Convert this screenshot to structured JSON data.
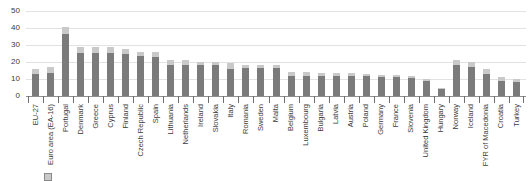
{
  "chart_data": {
    "type": "bar",
    "title": "",
    "subtitle": "",
    "xlabel": "",
    "ylabel": "",
    "ylim": [
      0,
      50
    ],
    "yticks": [
      0,
      10,
      20,
      30,
      40,
      50
    ],
    "grid": true,
    "legend_position": "bottom",
    "orientation": "vertical",
    "xtick_rotation": -90,
    "categories": [
      "EU-27",
      "Euro area (EA-16)",
      "Portugal",
      "Denmark",
      "Greece",
      "Cyprus",
      "Finland",
      "Czech Republic",
      "Spain",
      "Lithuania",
      "Netherlands",
      "Ireland",
      "Slovakia",
      "Italy",
      "Romania",
      "Sweden",
      "Malta",
      "Belgium",
      "Luxembourg",
      "Bulgaria",
      "Latvia",
      "Austria",
      "Poland",
      "Germany",
      "France",
      "Slovenia",
      "United Kingdom",
      "Hungary",
      "Norway",
      "Iceland",
      "FYR of Macedonia",
      "Croatia",
      "Turkey"
    ],
    "series": [
      {
        "name": "lower-segment",
        "color": "#7b7b7b",
        "values": [
          13.0,
          13.5,
          36.5,
          25.5,
          25.5,
          25.5,
          25.0,
          23.5,
          23.0,
          18.5,
          18.5,
          18.0,
          18.0,
          16.0,
          16.5,
          16.5,
          16.5,
          12.0,
          12.0,
          12.0,
          12.0,
          12.0,
          11.5,
          11.0,
          11.0,
          10.5,
          9.0,
          4.0,
          18.0,
          17.0,
          13.0,
          9.0,
          8.0
        ]
      },
      {
        "name": "upper-segment",
        "color": "#c9c9c9",
        "values": [
          3.0,
          3.5,
          4.0,
          3.5,
          3.5,
          3.5,
          2.5,
          2.5,
          3.0,
          2.5,
          2.5,
          2.0,
          2.0,
          3.5,
          2.0,
          2.0,
          2.0,
          2.0,
          2.0,
          1.5,
          1.5,
          1.5,
          1.5,
          1.5,
          1.5,
          1.5,
          1.0,
          1.0,
          3.0,
          3.0,
          3.0,
          2.0,
          2.0
        ]
      }
    ],
    "totals": [
      16.0,
      17.0,
      40.5,
      29.0,
      29.0,
      29.0,
      27.5,
      26.0,
      26.0,
      21.0,
      21.0,
      20.0,
      20.0,
      19.5,
      18.5,
      18.5,
      18.5,
      14.0,
      14.0,
      13.5,
      13.5,
      13.5,
      13.0,
      12.5,
      12.5,
      12.0,
      10.0,
      5.0,
      21.0,
      20.0,
      16.0,
      11.0,
      10.0
    ]
  },
  "legend": {
    "entries": [
      {
        "label": "",
        "color": "#c9c9c9"
      }
    ]
  }
}
